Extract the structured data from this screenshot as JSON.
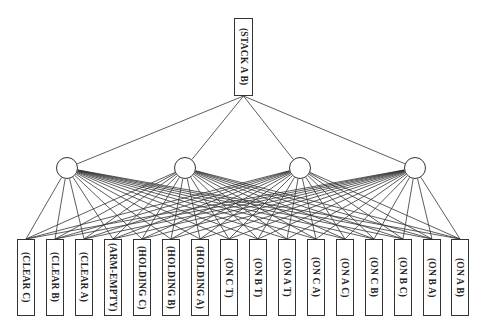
{
  "diagram": {
    "type": "plan-graph",
    "root": {
      "label": "(STACK A B)"
    },
    "hidden_nodes": [
      {
        "id": "h1"
      },
      {
        "id": "h2"
      },
      {
        "id": "h3"
      },
      {
        "id": "h4"
      }
    ],
    "leaves": [
      {
        "label": "(CLEAR C)"
      },
      {
        "label": "(CLEAR B)"
      },
      {
        "label": "(CLEAR A)"
      },
      {
        "label": "(ARM-EMPTY)"
      },
      {
        "label": "(HOLDING C)"
      },
      {
        "label": "(HOLDING B)"
      },
      {
        "label": "(HOLDING A)"
      },
      {
        "label": "(ON C T)"
      },
      {
        "label": "(ON B T)"
      },
      {
        "label": "(ON A T)"
      },
      {
        "label": "(ON C A)"
      },
      {
        "label": "(ON A C)"
      },
      {
        "label": "(ON C B)"
      },
      {
        "label": "(ON B C)"
      },
      {
        "label": "(ON B A)"
      },
      {
        "label": "(ON A B)"
      }
    ],
    "edges": "root connects to each of 4 circle nodes; each circle node connects to all 16 leaf boxes",
    "colors": {
      "stroke": "#333333",
      "background": "#ffffff",
      "text": "#222222"
    }
  }
}
